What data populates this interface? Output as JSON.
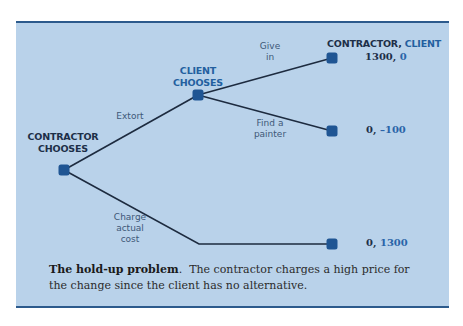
{
  "figure": {
    "type": "game-tree",
    "nodes": {
      "contractor": {
        "label_line1": "CONTRACTOR",
        "label_line2": "CHOOSES"
      },
      "client": {
        "label_line1": "CLIENT",
        "label_line2": "CHOOSES"
      }
    },
    "branches": {
      "extort": "Extort",
      "charge_line1": "Charge",
      "charge_line2": "actual",
      "charge_line3": "cost",
      "give_line1": "Give",
      "give_line2": "in",
      "find_line1": "Find a",
      "find_line2": "painter"
    },
    "payoff_header": {
      "contractor": "CONTRACTOR,",
      "client": "CLIENT"
    },
    "payoffs": [
      {
        "contractor": "1300,",
        "client": "0"
      },
      {
        "contractor": "0,",
        "client": "–100"
      },
      {
        "contractor": "0,",
        "client": "1300"
      }
    ],
    "colors": {
      "background": "#b9d2ea",
      "rule": "#2c5a8c",
      "node": "#1f5593",
      "edge": "#1d2b3f",
      "client_accent": "#235f9f"
    }
  },
  "caption": {
    "title": "The hold-up problem",
    "title_suffix": ".",
    "text": "The contractor charges a high price for the change since the client has no alternative."
  }
}
